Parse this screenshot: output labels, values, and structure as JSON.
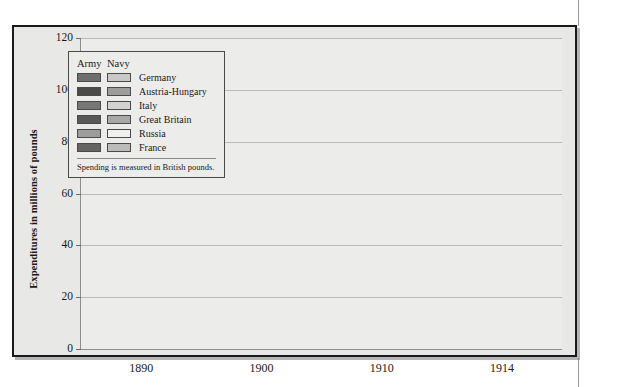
{
  "figure": {
    "y_axis_title": "Expenditures in millions of pounds"
  },
  "legend": {
    "header_army": "Army",
    "header_navy": "Navy",
    "note": "Spending is measured in British pounds.",
    "entries": [
      {
        "label": "Germany",
        "army_color": "#6e6e6e",
        "navy_color": "#c9c9c7"
      },
      {
        "label": "Austria-Hungary",
        "army_color": "#4a4a4a",
        "navy_color": "#9d9d9b"
      },
      {
        "label": "Italy",
        "army_color": "#777775",
        "navy_color": "#d2d2d0"
      },
      {
        "label": "Great Britain",
        "army_color": "#5a5a58",
        "navy_color": "#a8a8a6"
      },
      {
        "label": "Russia",
        "army_color": "#9d9d9b",
        "navy_color": "#efefed"
      },
      {
        "label": "France",
        "army_color": "#646462",
        "navy_color": "#bcbcba"
      }
    ]
  },
  "chart_data": {
    "type": "bar",
    "subtype": "stacked-grouped",
    "title": "",
    "xlabel": "",
    "ylabel": "Expenditures in millions of pounds",
    "ylim": [
      0,
      120
    ],
    "yticks": [
      0,
      20,
      40,
      60,
      80,
      100,
      120
    ],
    "grid": true,
    "legend_position": "inside-top-left",
    "categories": [
      "1890",
      "1900",
      "1910",
      "1914"
    ],
    "countries": [
      "Germany",
      "Austria-Hungary",
      "Italy",
      "Great Britain",
      "Russia",
      "France"
    ],
    "stack_keys": [
      "Army",
      "Navy"
    ],
    "series": [
      {
        "name": "Germany",
        "army": [
          26,
          34,
          33,
          89
        ],
        "navy": [
          4,
          6,
          17,
          22
        ],
        "total": [
          30,
          40,
          50,
          111
        ]
      },
      {
        "name": "Austria-Hungary",
        "army": [
          10,
          11,
          16,
          30
        ],
        "navy": [
          1,
          2,
          3,
          8
        ],
        "total": [
          11,
          13,
          19,
          38
        ]
      },
      {
        "name": "Italy",
        "army": [
          10,
          10,
          17,
          19
        ],
        "navy": [
          5,
          5,
          8,
          10
        ],
        "total": [
          15,
          15,
          25,
          29
        ]
      },
      {
        "name": "Great Britain",
        "army": [
          18,
          20,
          28,
          30
        ],
        "navy": [
          13,
          30,
          42,
          48
        ],
        "total": [
          31,
          50,
          70,
          78
        ]
      },
      {
        "name": "Russia",
        "army": [
          25,
          32,
          55,
          66
        ],
        "navy": [
          0,
          0,
          0,
          22
        ],
        "total": [
          25,
          32,
          55,
          88
        ]
      },
      {
        "name": "France",
        "army": [
          28,
          28,
          40,
          41
        ],
        "navy": [
          10,
          14,
          15,
          15
        ],
        "total": [
          38,
          42,
          55,
          56
        ]
      }
    ]
  }
}
